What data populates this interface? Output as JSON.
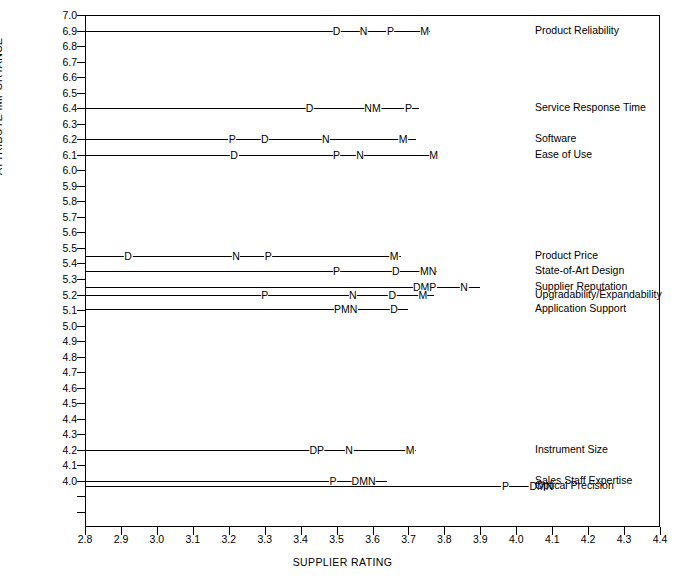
{
  "chart_data": {
    "type": "scatter",
    "title": "",
    "xlabel": "SUPPLIER RATING",
    "ylabel": "ATTRIBUTE IMPORTANCE",
    "xlim": [
      2.8,
      4.4
    ],
    "ylim": [
      3.92,
      7.0
    ],
    "grid": false,
    "legend": "right-labels",
    "x_ticks": [
      "2.8",
      "2.9",
      "3.0",
      "3.1",
      "3.2",
      "3.3",
      "3.4",
      "3.5",
      "3.6",
      "3.7",
      "3.8",
      "3.9",
      "4.0",
      "4.1",
      "4.2",
      "4.3",
      "4.4"
    ],
    "y_ticks": [
      "7.0",
      "6.9",
      "6.8",
      "6.7",
      "6.6",
      "6.5",
      "6.4",
      "6.3",
      "6.2",
      "6.1",
      "6.0",
      "5.9",
      "5.8",
      "5.7",
      "5.6",
      "5.5",
      "5.4",
      "5.3",
      "5.2",
      "5.1",
      "5.0",
      "4.9",
      "4.8",
      "4.7",
      "4.6",
      "4.5",
      "4.4",
      "4.3",
      "4.2",
      "4.1",
      "4.0"
    ],
    "y_extra_unlabeled_ticks": [
      3.9,
      3.8
    ],
    "supplier_codes": [
      "D",
      "N",
      "P",
      "M"
    ],
    "rows": [
      {
        "label": "Product Reliability",
        "importance": 6.9,
        "line_from": 2.8,
        "line_to": 3.76,
        "markers": [
          {
            "code": "D",
            "rating": 3.5
          },
          {
            "code": "N",
            "rating": 3.575
          },
          {
            "code": "P",
            "rating": 3.65
          },
          {
            "code": "M",
            "rating": 3.745
          }
        ]
      },
      {
        "label": "Service Response Time",
        "importance": 6.4,
        "line_from": 2.8,
        "line_to": 3.73,
        "markers": [
          {
            "code": "D",
            "rating": 3.425
          },
          {
            "code": "NM",
            "rating": 3.6
          },
          {
            "code": "P",
            "rating": 3.7
          }
        ]
      },
      {
        "label": "Software",
        "importance": 6.2,
        "line_from": 2.8,
        "line_to": 3.72,
        "markers": [
          {
            "code": "P",
            "rating": 3.21
          },
          {
            "code": "D",
            "rating": 3.3
          },
          {
            "code": "N",
            "rating": 3.47
          },
          {
            "code": "M",
            "rating": 3.685
          }
        ]
      },
      {
        "label": "Ease of Use",
        "importance": 6.1,
        "line_from": 2.8,
        "line_to": 3.78,
        "markers": [
          {
            "code": "D",
            "rating": 3.215
          },
          {
            "code": "P",
            "rating": 3.5
          },
          {
            "code": "N",
            "rating": 3.565
          },
          {
            "code": "M",
            "rating": 3.77
          }
        ]
      },
      {
        "label": "Product Price",
        "importance": 5.45,
        "line_from": 2.8,
        "line_to": 3.68,
        "markers": [
          {
            "code": "D",
            "rating": 2.92
          },
          {
            "code": "N",
            "rating": 3.22
          },
          {
            "code": "P",
            "rating": 3.31
          },
          {
            "code": "M",
            "rating": 3.66
          }
        ]
      },
      {
        "label": "State-of-Art Design",
        "importance": 5.35,
        "line_from": 2.8,
        "line_to": 3.78,
        "markers": [
          {
            "code": "P",
            "rating": 3.5
          },
          {
            "code": "D",
            "rating": 3.665
          },
          {
            "code": "MN",
            "rating": 3.755
          }
        ]
      },
      {
        "label": "Supplier Reputation",
        "importance": 5.25,
        "line_from": 2.8,
        "line_to": 3.9,
        "markers": [
          {
            "code": "DMP",
            "rating": 3.745
          },
          {
            "code": "N",
            "rating": 3.855
          }
        ]
      },
      {
        "label": "Upgradability/Expandability",
        "importance": 5.2,
        "line_from": 2.8,
        "line_to": 3.77,
        "markers": [
          {
            "code": "P",
            "rating": 3.3
          },
          {
            "code": "N",
            "rating": 3.545
          },
          {
            "code": "D",
            "rating": 3.655
          },
          {
            "code": "M",
            "rating": 3.74
          }
        ]
      },
      {
        "label": "Application Support",
        "importance": 5.11,
        "line_from": 2.8,
        "line_to": 3.7,
        "markers": [
          {
            "code": "PMN",
            "rating": 3.525
          },
          {
            "code": "D",
            "rating": 3.66
          }
        ]
      },
      {
        "label": "Instrument Size",
        "importance": 4.2,
        "line_from": 2.8,
        "line_to": 3.72,
        "markers": [
          {
            "code": "DP",
            "rating": 3.445
          },
          {
            "code": "N",
            "rating": 3.535
          },
          {
            "code": "M",
            "rating": 3.705
          }
        ]
      },
      {
        "label": "Sales Staff Expertise",
        "importance": 4.0,
        "line_from": 2.8,
        "line_to": 3.64,
        "markers": [
          {
            "code": "P",
            "rating": 3.49
          },
          {
            "code": "DMN",
            "rating": 3.575
          }
        ]
      },
      {
        "label": "Optical Precision",
        "importance": 3.965,
        "line_from": 2.8,
        "line_to": 4.09,
        "markers": [
          {
            "code": "P",
            "rating": 3.97
          },
          {
            "code": "DMN",
            "rating": 4.07
          }
        ]
      }
    ]
  }
}
